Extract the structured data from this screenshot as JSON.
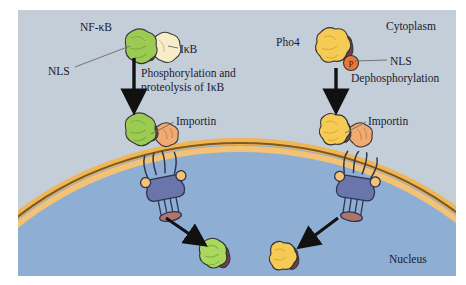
{
  "figure": {
    "type": "cell-biology-diagram",
    "compartments": {
      "cytoplasm_label": "Cytoplasm",
      "nucleus_label": "Nucleus",
      "cytoplasm_color": "#c3ced9",
      "nucleus_color": "#8eaed4",
      "membrane_color": "#f0b555",
      "membrane_inner_color": "#f4c274",
      "membrane_line_color": "#7d5a22"
    },
    "pathways": [
      {
        "id": "nf-kb",
        "side": "left",
        "factor_label": "NF-κB",
        "inhibitor_label": "IκB",
        "signal_label": "NLS",
        "step_label": "Phosphorylation and\nproteolysis of IκB",
        "step_line_1": "Phosphorylation and",
        "step_line_2": "proteolysis of IκB",
        "carrier_label": "Importin",
        "factor_color": "#9ccb54",
        "inhibitor_color": "#f7eec8",
        "nls_color": "#6b3f52",
        "carrier_color": "#efab72"
      },
      {
        "id": "pho4",
        "side": "right",
        "factor_label": "Pho4",
        "modification_label": "P",
        "signal_label": "NLS",
        "step_label": "Dephosphorylation",
        "carrier_label": "Importin",
        "factor_color": "#f5cb55",
        "phosphate_color": "#e8763a",
        "nls_color": "#6b3f52",
        "carrier_color": "#efab72"
      }
    ],
    "pore": {
      "name": "nuclear pore complex",
      "body_color": "#6a76ab",
      "filament_color": "#5a66a0",
      "basket_ring_color": "#b0756a",
      "ring_color": "#f4c274"
    }
  }
}
